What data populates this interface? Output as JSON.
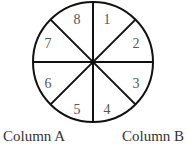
{
  "diagram": {
    "type": "circle-divided-into-8-sectors",
    "sectors": [
      {
        "label": "1",
        "x": 107,
        "y": 24
      },
      {
        "label": "2",
        "x": 136,
        "y": 48
      },
      {
        "label": "3",
        "x": 136,
        "y": 88
      },
      {
        "label": "4",
        "x": 107,
        "y": 114
      },
      {
        "label": "5",
        "x": 77,
        "y": 114
      },
      {
        "label": "6",
        "x": 48,
        "y": 88
      },
      {
        "label": "7",
        "x": 48,
        "y": 48
      },
      {
        "label": "8",
        "x": 77,
        "y": 24
      }
    ],
    "captions": {
      "left": "Column A",
      "right": "Column B"
    },
    "colors": {
      "stroke": "#111111",
      "number": "#555555",
      "caption": "#333333"
    }
  }
}
